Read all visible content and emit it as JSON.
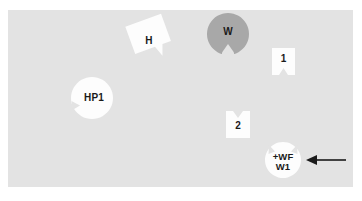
{
  "scene": {
    "background_color": "#ffffff",
    "field_color": "#e3e3e3",
    "title": ""
  },
  "markers": [
    {
      "id": "h",
      "label": "H",
      "lines": [
        "H"
      ],
      "shape": "rotated-square-notched",
      "fill": "#fdfdfd",
      "notch": "bottom-right",
      "rotation": -20
    },
    {
      "id": "w",
      "label": "W",
      "lines": [
        "W"
      ],
      "shape": "circle-notched",
      "fill": "#a8a8a8",
      "notch": "bottom",
      "rotation": 0
    },
    {
      "id": "one",
      "label": "1",
      "lines": [
        "1"
      ],
      "shape": "rect-notched",
      "fill": "#fdfdfd",
      "notch": "bottom",
      "rotation": 0
    },
    {
      "id": "hp1",
      "label": "HP1",
      "lines": [
        "HP1"
      ],
      "shape": "circle-notched",
      "fill": "#fdfdfd",
      "notch": "left",
      "rotation": 0
    },
    {
      "id": "two",
      "label": "2",
      "lines": [
        "2"
      ],
      "shape": "rect-notched",
      "fill": "#fdfdfd",
      "notch": "top",
      "rotation": 0
    },
    {
      "id": "wfw1",
      "label": "+WF W1",
      "lines": [
        "+WF",
        "W1"
      ],
      "shape": "circle-notched",
      "fill": "#fdfdfd",
      "notch": "top-left-and-top-right",
      "rotation": 0
    },
    {
      "id": "arrow",
      "label": "",
      "lines": [],
      "shape": "arrow-left",
      "fill": "#1a1a1a",
      "notch": "none",
      "rotation": 0
    }
  ],
  "labels": {
    "h": "H",
    "w": "W",
    "one": "1",
    "hp1": "HP1",
    "two": "2",
    "wfw1_line1": "+WF",
    "wfw1_line2": "W1"
  }
}
